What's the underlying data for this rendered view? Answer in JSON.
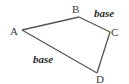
{
  "diagram": {
    "type": "quadrilateral",
    "vertices": [
      {
        "label": "A",
        "x": 22,
        "y": 30,
        "label_x": 10,
        "label_y": 35
      },
      {
        "label": "B",
        "x": 79,
        "y": 17,
        "label_x": 72,
        "label_y": 13
      },
      {
        "label": "C",
        "x": 110,
        "y": 32,
        "label_x": 111,
        "label_y": 36
      },
      {
        "label": "D",
        "x": 97,
        "y": 73,
        "label_x": 96,
        "label_y": 83
      }
    ],
    "edges": [
      {
        "from": "A",
        "to": "B"
      },
      {
        "from": "B",
        "to": "C",
        "label": "base"
      },
      {
        "from": "C",
        "to": "D"
      },
      {
        "from": "D",
        "to": "A",
        "label": "base"
      }
    ],
    "side_labels": [
      {
        "text": "base",
        "side": "BC",
        "x": 94,
        "y": 17
      },
      {
        "text": "base",
        "side": "AD",
        "x": 33,
        "y": 63
      }
    ],
    "colors": {
      "edge": "#555555",
      "text": "#3a3a3a",
      "background": "#ffffff"
    }
  }
}
